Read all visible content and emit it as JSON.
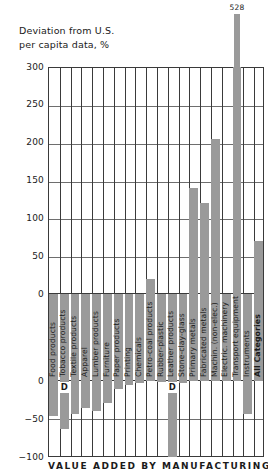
{
  "axis_title_line1": "Deviation from U.S.",
  "axis_title_line2": "per capita data, %",
  "caption": "VALUE ADDED BY MANUFACTURING",
  "overflow_label": "528",
  "d_marker": "D",
  "colors": {
    "bar": "#9a9a9a",
    "axis": "#3a3a3a",
    "grid": "#6e6e6e",
    "text": "#1a1a1a",
    "background": "#ffffff"
  },
  "chart_data": {
    "type": "bar",
    "title": "VALUE ADDED BY MANUFACTURING",
    "xlabel": "",
    "ylabel": "Deviation from U.S. per capita data, %",
    "ylim": [
      -100,
      300
    ],
    "yticks_upper": [
      0,
      50,
      100,
      150,
      200,
      250,
      300
    ],
    "yticks_lower": [
      0,
      -50,
      -100
    ],
    "axis_break": true,
    "grid": true,
    "legend": null,
    "note": "Axis is broken: upper panel 0 to 300, lower panel 0 to -100. Category labels sit between the two panels. Bar for Transport equipment exceeds the 300 limit and is annotated 528.",
    "categories": [
      "Food products",
      "Tobacco products",
      "Textile products",
      "Apparel",
      "Lumber products",
      "Furniture",
      "Paper products",
      "Printing",
      "Chemicals",
      "Petro-coal products",
      "Rubber-plastic",
      "Leather products",
      "Stone-clay-glass",
      "Primary metals",
      "Fabricated metals",
      "Machin. (non-elec.)",
      "Electric. machinery",
      "Transport equipment",
      "Instruments",
      "All Categories"
    ],
    "values": [
      -46,
      -63,
      -44,
      -36,
      -40,
      -29,
      -11,
      -5,
      -2,
      20,
      -1,
      -100,
      -3,
      140,
      120,
      205,
      0,
      528,
      -44,
      70
    ],
    "value_notes": {
      "Leather products": "no bar shown / data suppressed (D)",
      "Tobacco products": "data suppressed (D)",
      "Transport equipment": "528, bar clipped at axis top"
    },
    "d_markers": [
      "Tobacco products",
      "Leather products"
    ]
  }
}
